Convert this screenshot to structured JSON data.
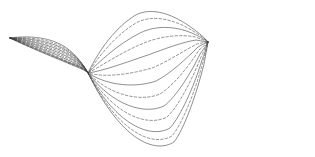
{
  "figure": {
    "title": "",
    "background_color": "#ffffff",
    "width": 315,
    "height": 157
  },
  "chart_data": {
    "type": "line",
    "title": "",
    "subtitle": "",
    "xlabel": "",
    "ylabel": "",
    "xlim": [
      0,
      315
    ],
    "ylim": [
      0,
      157
    ],
    "grid": false,
    "axes_visible": false,
    "legend": false,
    "legend_position": "none",
    "tick_labels_x": [],
    "tick_labels_y": [],
    "annotations": [],
    "nodes": [
      {
        "name": "left-tip-node",
        "x": 10,
        "y": 38
      },
      {
        "name": "middle-crossing-node",
        "x": 88,
        "y": 73
      },
      {
        "name": "right-node",
        "x": 208,
        "y": 42
      }
    ],
    "line_color": "#3a3a3a",
    "line_width": 0.6,
    "dash_pattern": "2.5,2",
    "series": [
      {
        "name": "curve-1",
        "style": "solid",
        "opacity": 0.95,
        "path": "M10,38 C24,36 44,36 60,44 C74,51 82,63 88,73 C96,56 112,30 134,16 C152,5 176,16 192,28 C199,33 205,38 208,42"
      },
      {
        "name": "curve-2",
        "style": "dashed",
        "opacity": 0.9,
        "path": "M10,38 C24,37 45,38 61,46 C75,53 83,64 88,73 C97,59 114,36 136,23 C154,13 177,21 193,31 C200,35 205,39 208,42"
      },
      {
        "name": "curve-3",
        "style": "solid",
        "opacity": 0.95,
        "path": "M10,38 C25,38 46,40 62,48 C76,55 84,65 88,73 C99,62 118,44 140,33 C158,24 179,27 194,34 C200,37 206,40 208,42"
      },
      {
        "name": "curve-4",
        "style": "dashed",
        "opacity": 0.9,
        "path": "M10,38 C25,39 47,42 63,50 C77,57 84,66 88,73 C101,66 122,52 144,43 C161,36 181,34 195,37 C201,39 206,41 208,42"
      },
      {
        "name": "curve-5",
        "style": "solid",
        "opacity": 0.95,
        "path": "M10,38 C26,40 48,44 64,52 C78,59 85,67 88,73 C103,71 127,62 148,55 C164,49 183,42 196,40 C202,41 206,42 208,42"
      },
      {
        "name": "curve-6",
        "style": "dashed",
        "opacity": 0.9,
        "path": "M10,38 C26,41 49,46 65,54 C79,61 86,68 88,73 C106,78 131,74 152,68 C167,62 185,50 197,44 C202,43 206,42 208,42"
      },
      {
        "name": "curve-7",
        "style": "solid",
        "opacity": 0.95,
        "path": "M10,38 C27,42 50,48 66,56 C80,63 86,69 88,73 C108,86 136,88 156,81 C170,74 187,58 198,47 C203,44 206,43 208,42"
      },
      {
        "name": "curve-8",
        "style": "dashed",
        "opacity": 0.9,
        "path": "M10,38 C27,43 51,50 67,58 C81,64 87,70 88,73 C111,96 141,102 160,94 C173,86 189,66 199,50 C204,46 207,43 208,42"
      },
      {
        "name": "curve-9",
        "style": "solid",
        "opacity": 0.95,
        "path": "M10,38 C28,44 52,52 68,60 C82,66 87,71 88,73 C113,106 145,115 164,106 C176,97 191,73 200,54 C205,47 207,44 208,42"
      },
      {
        "name": "curve-10",
        "style": "dashed",
        "opacity": 0.9,
        "path": "M10,38 C28,45 53,54 69,62 C83,67 87,71 88,73 C115,116 148,127 167,117 C178,107 192,80 201,57 C205,49 207,44 208,42"
      },
      {
        "name": "curve-11",
        "style": "solid",
        "opacity": 0.95,
        "path": "M10,38 C29,46 54,56 70,63 C84,68 87,72 88,73 C117,126 151,139 170,128 C180,117 194,87 202,60 C206,50 207,45 208,42"
      },
      {
        "name": "curve-12",
        "style": "dashed",
        "opacity": 0.9,
        "path": "M10,38 C29,47 55,57 71,64 C85,69 87,72 88,73 C119,134 153,147 172,136 C182,124 195,92 203,62 C206,51 207,45 208,42"
      },
      {
        "name": "curve-13",
        "style": "solid",
        "opacity": 0.95,
        "path": "M10,38 C30,48 56,58 72,65 C85,70 87,72 88,73 C121,141 155,154 174,142 C184,129 196,96 204,64 C206,52 208,45 208,42"
      }
    ]
  }
}
